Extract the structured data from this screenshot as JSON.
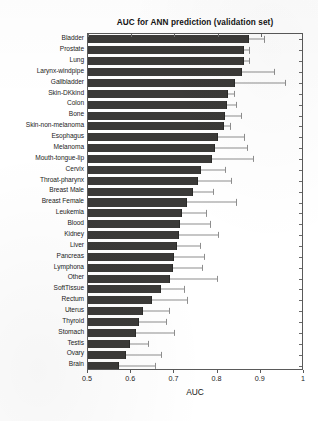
{
  "chart_data": {
    "type": "bar",
    "orientation": "horizontal",
    "title": "AUC for ANN prediction (validation set)",
    "xlabel": "AUC",
    "ylabel": "",
    "xlim": [
      0.5,
      1.0
    ],
    "xticks": [
      0.5,
      0.6,
      0.7,
      0.8,
      0.9,
      1
    ],
    "xtick_labels": [
      "0.5",
      "0.6",
      "0.7",
      "0.8",
      "0.9",
      "1"
    ],
    "grid": false,
    "legend": null,
    "bar_color": "#3b3a38",
    "error_color": "#8e8e8e",
    "error_bar_direction": "upper-only",
    "categories": [
      "Bladder",
      "Prostate",
      "Lung",
      "Larynx-windpipe",
      "Gallbladder",
      "Skin-DKkind",
      "Colon",
      "Bone",
      "Skin-non-melanoma",
      "Esophagus",
      "Melanoma",
      "Mouth-tongue-lip",
      "Cervix",
      "Throat-pharynx",
      "Breast Male",
      "Breast Female",
      "Leukemia",
      "Blood",
      "Kidney",
      "Liver",
      "Pancreas",
      "Lymphona",
      "Other",
      "SoftTissue",
      "Rectum",
      "Uterus",
      "Thyroid",
      "Stomach",
      "Testis",
      "Ovary",
      "Brain"
    ],
    "values": [
      0.872,
      0.862,
      0.86,
      0.857,
      0.841,
      0.823,
      0.822,
      0.818,
      0.815,
      0.8,
      0.795,
      0.788,
      0.762,
      0.755,
      0.742,
      0.73,
      0.718,
      0.712,
      0.71,
      0.705,
      0.7,
      0.697,
      0.69,
      0.668,
      0.648,
      0.628,
      0.618,
      0.612,
      0.598,
      0.588,
      0.572
    ],
    "error_upper": [
      0.908,
      0.872,
      0.872,
      0.93,
      0.955,
      0.838,
      0.842,
      0.855,
      0.828,
      0.862,
      0.867,
      0.882,
      0.818,
      0.832,
      0.79,
      0.842,
      0.772,
      0.782,
      0.8,
      0.76,
      0.768,
      0.765,
      0.798,
      0.722,
      0.73,
      0.688,
      0.68,
      0.7,
      0.64,
      0.668,
      0.655
    ]
  }
}
